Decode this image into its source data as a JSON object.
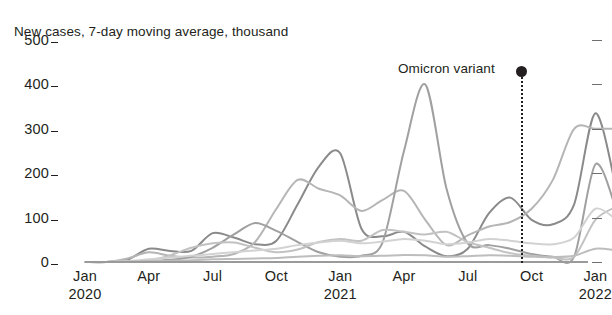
{
  "chart_data": {
    "type": "line",
    "title": "New cases, 7-day moving average, thousand",
    "xlabel": "",
    "ylabel": "",
    "ylim": [
      0,
      500
    ],
    "yticks": [
      0,
      100,
      200,
      300,
      400,
      500
    ],
    "ytick_labels": [
      "0",
      "100",
      "200",
      "300",
      "400",
      "500"
    ],
    "grid": false,
    "legend": "none",
    "x_axis": {
      "ticks": [
        {
          "month": "Jan",
          "year": "2020"
        },
        {
          "month": "Apr",
          "year": ""
        },
        {
          "month": "Jul",
          "year": ""
        },
        {
          "month": "Oct",
          "year": ""
        },
        {
          "month": "Jan",
          "year": "2021"
        },
        {
          "month": "Apr",
          "year": ""
        },
        {
          "month": "Jul",
          "year": ""
        },
        {
          "month": "Oct",
          "year": ""
        },
        {
          "month": "Jan",
          "year": "2022"
        }
      ],
      "range": [
        "2020-01",
        "2022-02"
      ]
    },
    "annotations": [
      {
        "label": "Omicron variant",
        "x": "2021-11",
        "marker": "dot",
        "line": "dotted-vertical"
      }
    ],
    "colors": {
      "series_dark": "#8a8a8a",
      "series_mid": "#a8a8a8",
      "series_light": "#c9c9c9",
      "series_faint": "#d9d9d9",
      "annotation": "#231f20",
      "text": "#231f20",
      "background": "#ffffff"
    },
    "x": [
      "2020-01",
      "2020-02",
      "2020-03",
      "2020-04",
      "2020-05",
      "2020-06",
      "2020-07",
      "2020-08",
      "2020-09",
      "2020-10",
      "2020-11",
      "2020-12",
      "2021-01",
      "2021-02",
      "2021-03",
      "2021-04",
      "2021-05",
      "2021-06",
      "2021-07",
      "2021-08",
      "2021-09",
      "2021-10",
      "2021-11",
      "2021-12",
      "2022-01",
      "2022-02"
    ],
    "series": [
      {
        "name": "United States",
        "color": "#8a8a8a",
        "values": [
          0,
          0,
          5,
          30,
          25,
          25,
          65,
          55,
          40,
          48,
          130,
          215,
          245,
          75,
          58,
          68,
          35,
          13,
          30,
          110,
          145,
          95,
          85,
          130,
          335,
          160
        ]
      },
      {
        "name": "Europe",
        "color": "#b5b5b5",
        "values": [
          0,
          0,
          8,
          22,
          14,
          10,
          12,
          18,
          45,
          120,
          185,
          165,
          150,
          115,
          140,
          160,
          95,
          38,
          60,
          80,
          90,
          120,
          185,
          300,
          300,
          300
        ]
      },
      {
        "name": "India",
        "color": "#a0a0a0",
        "values": [
          0,
          0,
          1,
          2,
          5,
          12,
          32,
          62,
          88,
          70,
          45,
          22,
          12,
          14,
          45,
          250,
          400,
          165,
          42,
          38,
          30,
          18,
          12,
          12,
          220,
          115
        ]
      },
      {
        "name": "Brazil",
        "color": "#c2c2c2",
        "values": [
          0,
          0,
          1,
          4,
          15,
          32,
          42,
          44,
          32,
          22,
          28,
          45,
          52,
          48,
          72,
          68,
          62,
          68,
          45,
          32,
          20,
          14,
          10,
          12,
          95,
          125
        ]
      },
      {
        "name": "Other",
        "color": "#d2d2d2",
        "values": [
          0,
          0,
          2,
          6,
          10,
          14,
          18,
          22,
          26,
          30,
          38,
          44,
          48,
          42,
          46,
          52,
          48,
          40,
          44,
          52,
          48,
          42,
          40,
          55,
          120,
          95
        ]
      },
      {
        "name": "Baseline",
        "color": "#bdbdbd",
        "values": [
          0,
          0,
          1,
          2,
          3,
          4,
          6,
          7,
          8,
          9,
          12,
          14,
          15,
          13,
          14,
          16,
          15,
          12,
          13,
          15,
          14,
          12,
          11,
          14,
          30,
          26
        ]
      }
    ]
  }
}
